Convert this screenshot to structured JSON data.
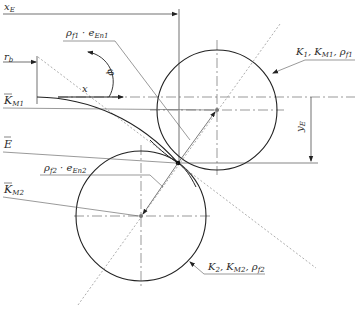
{
  "diagram": {
    "labels": {
      "xE": "x",
      "xE_sub": "E",
      "rho_f1": "ρ",
      "rho_f1_sub": "f1",
      "rho_f1_dot": " · ",
      "e_En1": "e",
      "e_En1_sub": "En1",
      "rb": "r",
      "rb_sub": "b",
      "phi": "φ",
      "x": "x",
      "KM1": "K",
      "KM1_sub": "M1",
      "E": "E",
      "rho_f2": "ρ",
      "rho_f2_sub": "f2",
      "rho_f2_dot": " · ",
      "e_En2": "e",
      "e_En2_sub": "En2",
      "KM2": "K",
      "KM2_sub": "M2",
      "circle1_label": "K",
      "circle1_label_parts": [
        "1",
        ", K",
        "M1",
        ", ρ",
        "f1"
      ],
      "circle2_label_parts": [
        "2",
        ", K",
        "M2",
        ", ρ",
        "f2"
      ],
      "yE": "y",
      "yE_sub": "E"
    },
    "geometry": {
      "circle1": {
        "cx": 217,
        "cy": 110,
        "r": 60
      },
      "circle2": {
        "cx": 141,
        "cy": 216,
        "r": 65
      },
      "contact_point": {
        "x": 178,
        "y": 163
      }
    },
    "colors": {
      "line": "#2a2a2a",
      "thin": "#555555",
      "dotted": "#9a9a9a"
    }
  }
}
